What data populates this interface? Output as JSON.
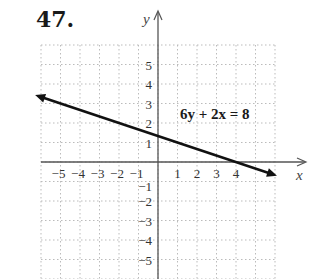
{
  "problem": {
    "number": "47."
  },
  "chart_data": {
    "type": "line",
    "title": "",
    "equation": "6y + 2x = 8",
    "xlabel": "x",
    "ylabel": "y",
    "xlim": [
      -6,
      6
    ],
    "ylim": [
      -6,
      6
    ],
    "grid": true,
    "x_ticks": [
      "-5",
      "-4",
      "-3",
      "-2",
      "-1",
      "1",
      "2",
      "3",
      "4"
    ],
    "y_ticks": [
      "5",
      "4",
      "3",
      "2",
      "1",
      "-1",
      "-2",
      "-3",
      "-4",
      "-5"
    ],
    "series": [
      {
        "name": "6y + 2x = 8",
        "x": [
          -6,
          0,
          4,
          6
        ],
        "y": [
          3.333,
          1.333,
          0,
          -0.667
        ]
      }
    ],
    "annotations": [
      {
        "text": "6y + 2x = 8",
        "x": 1.5,
        "y": 2.5
      }
    ]
  },
  "colors": {
    "line": "#111111",
    "axis": "#555555",
    "grid": "#bbbbbb"
  }
}
